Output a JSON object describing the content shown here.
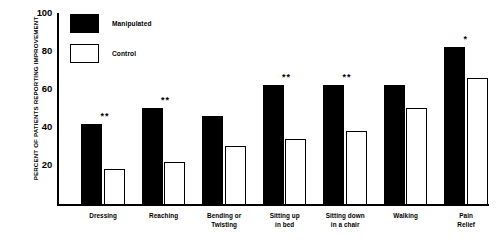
{
  "chart_data": {
    "type": "bar",
    "title": "",
    "xlabel": "",
    "ylabel": "PERCENT OF PATIENTS REPORTING IMPROVEMENT",
    "ylim": [
      0,
      100
    ],
    "yticks": [
      20,
      40,
      60,
      80,
      100
    ],
    "grid": false,
    "legend_position": "top-left",
    "categories": [
      "Dressing",
      "Reaching",
      "Bending or Twisting",
      "Sitting up in bed",
      "Sitting down in a chair",
      "Walking",
      "Pain Relief"
    ],
    "category_lines": [
      [
        "Dressing"
      ],
      [
        "Reaching"
      ],
      [
        "Bending or",
        "Twisting"
      ],
      [
        "Sitting up",
        "in bed"
      ],
      [
        "Sitting down",
        "in a chair"
      ],
      [
        "Walking"
      ],
      [
        "Pain",
        "Relief"
      ]
    ],
    "series": [
      {
        "name": "Manipulated",
        "color": "#000000",
        "values": [
          42,
          50,
          46,
          62,
          62,
          62,
          82
        ]
      },
      {
        "name": "Control",
        "color": "#ffffff",
        "values": [
          18,
          22,
          30,
          34,
          38,
          50,
          66
        ]
      }
    ],
    "significance": [
      "**",
      "**",
      "",
      "**",
      "**",
      "",
      "*"
    ]
  },
  "legend": {
    "items": [
      {
        "label": "Manipulated",
        "swatch": "filled"
      },
      {
        "label": "Control",
        "swatch": "hollow"
      }
    ]
  }
}
